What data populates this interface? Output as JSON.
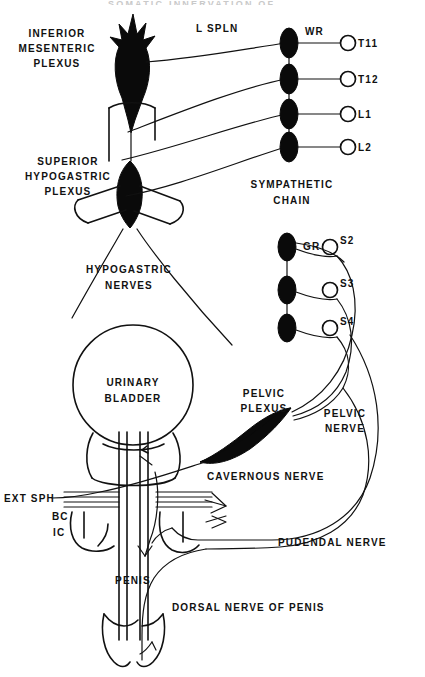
{
  "figure": {
    "title_partial": "SOMATIC INNERVATION OF...",
    "background_color": "#ffffff",
    "ink_color": "#111111",
    "solid_mass_color": "#0a0a0a"
  },
  "labels": {
    "inferior_mesenteric_plexus": [
      "INFERIOR",
      "MESENTERIC",
      "PLEXUS"
    ],
    "superior_hypogastric_plexus": [
      "SUPERIOR",
      "HYPOGASTRIC",
      "PLEXUS"
    ],
    "hypogastric_nerves": [
      "HYPOGASTRIC",
      "NERVES"
    ],
    "sympathetic_chain": [
      "SYMPATHETIC",
      "CHAIN"
    ],
    "urinary_bladder": [
      "URINARY",
      "BLADDER"
    ],
    "pelvic_plexus": [
      "PELVIC",
      "PLEXUS"
    ],
    "pelvic_nerve": [
      "PELVIC",
      "NERVE"
    ],
    "lumbar_splanchnic": "L SPLN",
    "white_ramus": "WR",
    "gray_ramus": "GR",
    "cavernous_nerve": "CAVERNOUS NERVE",
    "pudendal_nerve": "PUDENDAL NERVE",
    "dorsal_nerve_of_penis": "DORSAL NERVE OF PENIS",
    "ext_sphincter": "EXT SPH",
    "bulbocavernosus": "BC",
    "ischiocavernosus": "IC",
    "penis": "PENIS"
  },
  "spinal_levels": {
    "thoracolumbar": [
      {
        "id": "T11",
        "label": "T11",
        "root_x": 350,
        "root_y": 43,
        "ganglion_x": 289,
        "ganglion_y": 43
      },
      {
        "id": "T12",
        "label": "T12",
        "root_x": 350,
        "root_y": 79,
        "ganglion_x": 289,
        "ganglion_y": 79
      },
      {
        "id": "L1",
        "label": "L1",
        "root_x": 350,
        "root_y": 114,
        "ganglion_x": 289,
        "ganglion_y": 114
      },
      {
        "id": "L2",
        "label": "L2",
        "root_x": 350,
        "root_y": 147,
        "ganglion_x": 289,
        "ganglion_y": 147
      }
    ],
    "sacral": [
      {
        "id": "S2",
        "label": "S2",
        "root_x": 348,
        "root_y": 247,
        "ganglion_x": 287,
        "ganglion_y": 247
      },
      {
        "id": "S3",
        "label": "S3",
        "root_x": 348,
        "root_y": 290,
        "ganglion_x": 287,
        "ganglion_y": 290
      },
      {
        "id": "S4",
        "label": "S4",
        "root_x": 348,
        "root_y": 328,
        "ganglion_x": 287,
        "ganglion_y": 328
      }
    ]
  },
  "structures": {
    "inferior_mesenteric_plexus": {
      "type": "solid-spiky-mass",
      "cx": 133,
      "cy": 55
    },
    "superior_hypogastric_plexus": {
      "type": "solid-oval-mass",
      "cx": 130,
      "cy": 193
    },
    "pelvic_plexus": {
      "type": "solid-triangular-mass",
      "cx": 263,
      "cy": 425
    },
    "urinary_bladder": {
      "type": "circle",
      "cx": 133,
      "cy": 385,
      "r": 60
    },
    "sympathetic_chain": {
      "type": "ganglion-column",
      "ganglion_count": 4
    },
    "sacral_chain": {
      "type": "ganglion-column",
      "ganglion_count": 3
    }
  }
}
